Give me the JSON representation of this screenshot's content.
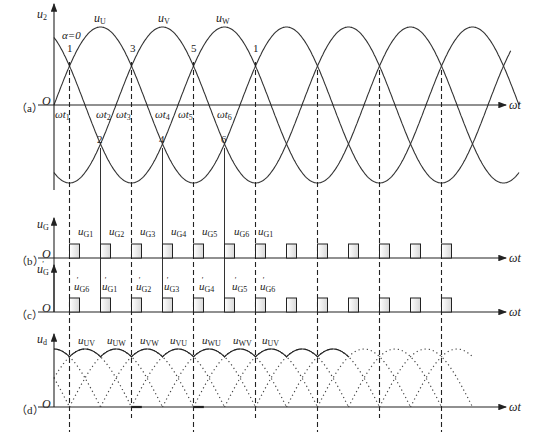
{
  "figure": {
    "panels": [
      {
        "id": "a",
        "label": "（a）",
        "y_axis_label": "u2",
        "x_axis_label": "ωt"
      },
      {
        "id": "b",
        "label": "（b）",
        "y_axis_label": "uG",
        "x_axis_label": "ωt"
      },
      {
        "id": "c",
        "label": "（c）",
        "y_axis_label": "u'G",
        "x_axis_label": "ωt"
      },
      {
        "id": "d",
        "label": "（d）",
        "y_axis_label": "ud",
        "x_axis_label": "ωt"
      }
    ],
    "origin_label": "O",
    "alpha_label": "α=0",
    "phase_labels": [
      "uU",
      "uV",
      "uW"
    ],
    "crossing_numbers_top": [
      "1",
      "3",
      "5",
      "1"
    ],
    "crossing_numbers_bottom": [
      "2",
      "4",
      "6"
    ],
    "time_labels": [
      "ωt1",
      "ωt2",
      "ωt3",
      "ωt4",
      "ωt5",
      "ωt6"
    ],
    "gate_pulses_b": [
      "uG1",
      "uG2",
      "uG3",
      "uG4",
      "uG5",
      "uG6",
      "uG1"
    ],
    "gate_pulses_c": [
      "u'G6",
      "u'G1",
      "u'G2",
      "u'G3",
      "u'G4",
      "u'G5",
      "u'G6"
    ],
    "line_voltages_d": [
      "uUV",
      "uUW",
      "uVW",
      "uVU",
      "uWU",
      "uWV",
      "uUV"
    ]
  },
  "chart_data": {
    "type": "line",
    "panels": {
      "a": {
        "ylabel": "u2",
        "xlabel": "ωt",
        "series": [
          {
            "name": "uU",
            "function": "sin(ωt)"
          },
          {
            "name": "uV",
            "function": "sin(ωt-120°)"
          },
          {
            "name": "uW",
            "function": "sin(ωt+120°)"
          }
        ],
        "natural_commutation_points": [
          "ωt1=30°",
          "ωt2=90°",
          "ωt3=150°",
          "ωt4=210°",
          "ωt5=270°",
          "ωt6=330°"
        ],
        "x_range_deg": [
          0,
          900
        ]
      },
      "b": {
        "ylabel": "uG",
        "type": "pulse_train",
        "pulse_spacing_deg": 60,
        "first_pulse_deg": 30,
        "pulses": [
          "uG1",
          "uG2",
          "uG3",
          "uG4",
          "uG5",
          "uG6",
          "uG1"
        ],
        "count": 13
      },
      "c": {
        "ylabel": "u'G",
        "type": "pulse_train",
        "pulse_spacing_deg": 60,
        "first_pulse_deg": 30,
        "pulses": [
          "u'G6",
          "u'G1",
          "u'G2",
          "u'G3",
          "u'G4",
          "u'G5",
          "u'G6"
        ],
        "count": 13
      },
      "d": {
        "ylabel": "ud",
        "type": "rectified_line_voltage",
        "segments": [
          "uUV",
          "uUW",
          "uVW",
          "uVU",
          "uWU",
          "uWV",
          "uUV"
        ],
        "segment_width_deg": 60
      }
    }
  }
}
